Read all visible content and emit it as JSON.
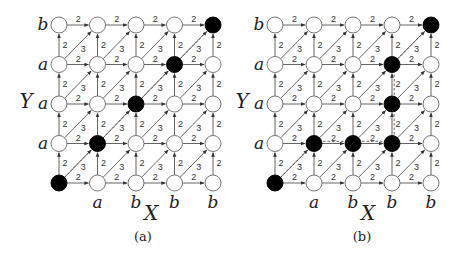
{
  "figure": {
    "node_radius": 8,
    "edge_color": "#555555",
    "node_fill_empty": "#ffffff",
    "node_fill_active": "#000000",
    "edge_weights": {
      "horizontal": "2",
      "vertical": "2",
      "diagonal": "3"
    },
    "panels": [
      {
        "id": "a",
        "caption": "(a)",
        "x_axis_label": "X",
        "y_axis_label": "Y",
        "col_labels": [
          "",
          "a",
          "b",
          "b",
          "b"
        ],
        "row_labels_bottom_to_top": [
          "",
          "a",
          "a",
          "a",
          "b"
        ],
        "origin": {
          "x": 59,
          "y": 183
        },
        "spacing": {
          "x": 38.5,
          "y": 39.5
        },
        "row_label_x": 43,
        "col_label_y": 208,
        "y_axis_pos": {
          "x": 26,
          "y": 108
        },
        "x_axis_pos": {
          "x": 151,
          "y": 220
        },
        "caption_pos": {
          "x": 143,
          "y": 241
        },
        "filled_nodes": [
          [
            0,
            0
          ],
          [
            1,
            1
          ],
          [
            2,
            2
          ],
          [
            3,
            3
          ],
          [
            4,
            4
          ]
        ],
        "path": [
          [
            0,
            0
          ],
          [
            1,
            1
          ],
          [
            2,
            2
          ],
          [
            3,
            3
          ],
          [
            4,
            4
          ]
        ]
      },
      {
        "id": "b",
        "caption": "(b)",
        "x_axis_label": "X",
        "y_axis_label": "Y",
        "col_labels": [
          "",
          "a",
          "b",
          "b",
          "b"
        ],
        "row_labels_bottom_to_top": [
          "",
          "a",
          "a",
          "a",
          "b"
        ],
        "origin": {
          "x": 275,
          "y": 183
        },
        "spacing": {
          "x": 39,
          "y": 39.5
        },
        "row_label_x": 259,
        "col_label_y": 208,
        "y_axis_pos": {
          "x": 242,
          "y": 108
        },
        "x_axis_pos": {
          "x": 368,
          "y": 220
        },
        "caption_pos": {
          "x": 362,
          "y": 241
        },
        "filled_nodes": [
          [
            0,
            0
          ],
          [
            1,
            1
          ],
          [
            2,
            1
          ],
          [
            3,
            1
          ],
          [
            3,
            2
          ],
          [
            3,
            3
          ],
          [
            4,
            4
          ]
        ],
        "path": [
          [
            0,
            0
          ],
          [
            1,
            1
          ],
          [
            2,
            1
          ],
          [
            3,
            1
          ],
          [
            3,
            2
          ],
          [
            3,
            3
          ],
          [
            4,
            4
          ]
        ]
      }
    ]
  }
}
